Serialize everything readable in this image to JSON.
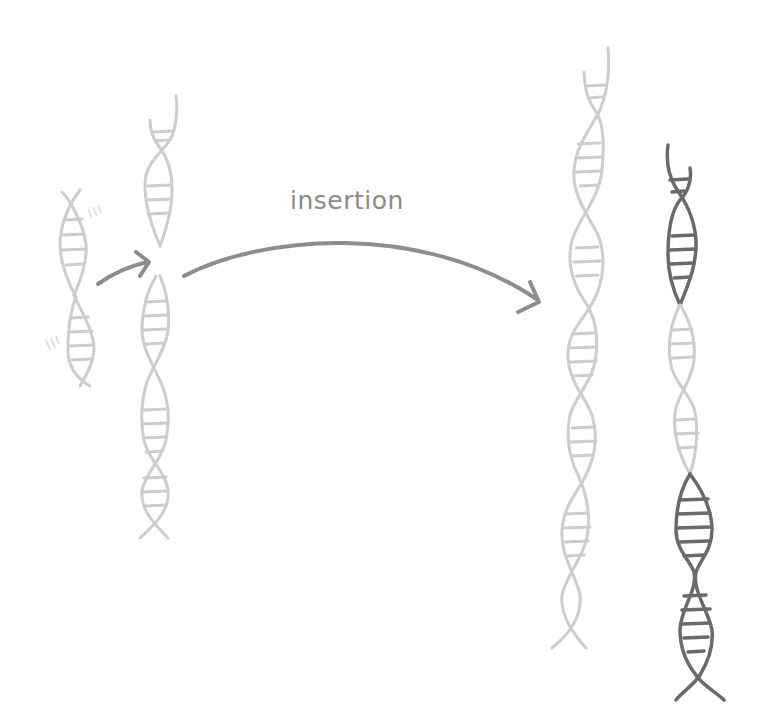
{
  "diagram": {
    "title_label": "insertion",
    "colors": {
      "background": "#ffffff",
      "light_dna": "#cdcdcd",
      "dark_dna": "#6a6a6a",
      "arrow": "#8d8d8d",
      "label": "#8a8a8a"
    },
    "elements": [
      {
        "id": "fragment",
        "description": "small free DNA fragment with motion lines",
        "color": "light"
      },
      {
        "id": "target-broken",
        "description": "target DNA strand broken at insertion site",
        "color": "light"
      },
      {
        "id": "small-arrow",
        "description": "arrow from fragment into break site"
      },
      {
        "id": "insertion-arrow",
        "description": "curved arrow labeled insertion"
      },
      {
        "id": "result-light",
        "description": "resulting DNA strand (light)",
        "color": "light"
      },
      {
        "id": "result-highlighted",
        "description": "resulting DNA strand with inserted segments highlighted dark",
        "color": "mixed"
      }
    ]
  }
}
